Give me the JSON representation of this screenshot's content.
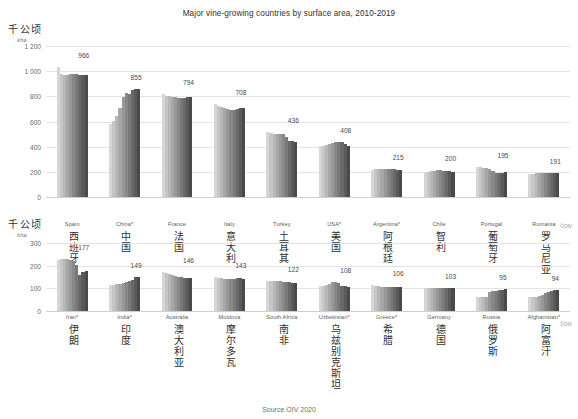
{
  "title": "Major vine-growing countries by surface area, 2010-2019",
  "source": "Source OIV 2020",
  "copyright": "©OIV",
  "units": {
    "cn": "千公顷",
    "en": "kha"
  },
  "chart_data": {
    "type": "bar",
    "title": "Major vine-growing countries by surface area, 2010-2019",
    "xlabel": "",
    "ylabel": "kha",
    "grid": true,
    "legend": "none",
    "years": [
      2010,
      2011,
      2012,
      2013,
      2014,
      2015,
      2016,
      2017,
      2018,
      2019
    ],
    "panels": [
      {
        "name": "top",
        "ylim": [
          0,
          1200
        ],
        "yticks": [
          0,
          200,
          400,
          600,
          800,
          1000,
          1200
        ],
        "ytick_labels": [
          "0",
          "200",
          "400",
          "600",
          "800",
          "1 000",
          "1 200"
        ],
        "categories": [
          {
            "en": "Spain",
            "cn": "西班牙",
            "label": "966",
            "values": [
              1032,
              974,
              969,
              973,
              974,
              974,
              975,
              967,
              966,
              966
            ]
          },
          {
            "en": "China*",
            "cn": "中国",
            "label": "855",
            "values": [
              580,
              605,
              645,
              705,
              795,
              830,
              818,
              847,
              857,
              855
            ]
          },
          {
            "en": "France",
            "cn": "法国",
            "label": "794",
            "values": [
              818,
              806,
              800,
              794,
              791,
              786,
              786,
              787,
              793,
              794
            ]
          },
          {
            "en": "Italy",
            "cn": "意大利",
            "label": "708",
            "values": [
              739,
              726,
              713,
              705,
              697,
              690,
              695,
              699,
              705,
              708
            ]
          },
          {
            "en": "Turkey",
            "cn": "土耳其",
            "label": "436",
            "values": [
              514,
              508,
              497,
              504,
              502,
              497,
              480,
              448,
              448,
              436
            ]
          },
          {
            "en": "USA*",
            "cn": "美国",
            "label": "408",
            "values": [
              404,
              408,
              415,
              425,
              430,
              434,
              437,
              434,
              418,
              408
            ]
          },
          {
            "en": "Argentina*",
            "cn": "阿根廷",
            "label": "215",
            "values": [
              218,
              219,
              222,
              224,
              226,
              225,
              224,
              222,
              218,
              215
            ]
          },
          {
            "en": "Chile",
            "cn": "智利",
            "label": "200",
            "values": [
              200,
              202,
              205,
              208,
              211,
              211,
              209,
              206,
              203,
              200
            ]
          },
          {
            "en": "Portugal",
            "cn": "葡萄牙",
            "label": "195",
            "values": [
              239,
              236,
              231,
              229,
              224,
              203,
              194,
              194,
              192,
              195
            ]
          },
          {
            "en": "Romania",
            "cn": "罗马尼亚",
            "label": "191",
            "values": [
              181,
              184,
              188,
              190,
              192,
              191,
              191,
              191,
              191,
              191
            ]
          }
        ]
      },
      {
        "name": "bottom",
        "ylim": [
          0,
          300
        ],
        "yticks": [
          0,
          100,
          200,
          300
        ],
        "ytick_labels": [
          "0",
          "100",
          "200",
          "300"
        ],
        "categories": [
          {
            "en": "Iran*",
            "cn": "伊朗",
            "label": "177",
            "values": [
              225,
              230,
              231,
              230,
              225,
              220,
              205,
              160,
              170,
              177
            ]
          },
          {
            "en": "India*",
            "cn": "印度",
            "label": "149",
            "values": [
              113,
              115,
              119,
              120,
              124,
              128,
              131,
              138,
              150,
              149
            ]
          },
          {
            "en": "Australia",
            "cn": "澳大利亚",
            "label": "146",
            "values": [
              170,
              166,
              162,
              157,
              154,
              150,
              149,
              146,
              146,
              146
            ]
          },
          {
            "en": "Moldova",
            "cn": "摩尔多瓦",
            "label": "143",
            "values": [
              148,
              147,
              144,
              141,
              140,
              140,
              141,
              146,
              145,
              143
            ]
          },
          {
            "en": "South Africa",
            "cn": "南非",
            "label": "122",
            "values": [
              132,
              131,
              131,
              131,
              132,
              130,
              129,
              127,
              125,
              122
            ]
          },
          {
            "en": "Uzbekistan*",
            "cn": "乌兹别克斯坦",
            "label": "108",
            "values": [
              110,
              111,
              116,
              121,
              126,
              130,
              122,
              112,
              110,
              108
            ]
          },
          {
            "en": "Greece*",
            "cn": "希腊",
            "label": "106",
            "values": [
              113,
              111,
              110,
              108,
              107,
              107,
              106,
              106,
              106,
              106
            ]
          },
          {
            "en": "Germany",
            "cn": "德国",
            "label": "103",
            "values": [
              102,
              102,
              102,
              102,
              102,
              103,
              103,
              103,
              103,
              103
            ]
          },
          {
            "en": "Russia",
            "cn": "俄罗斯",
            "label": "95",
            "values": [
              62,
              62,
              62,
              62,
              85,
              88,
              89,
              92,
              94,
              95
            ]
          },
          {
            "en": "Afghanistan*",
            "cn": "阿富汗",
            "label": "94",
            "values": [
              60,
              62,
              64,
              66,
              72,
              78,
              84,
              90,
              93,
              94
            ]
          }
        ]
      }
    ]
  }
}
